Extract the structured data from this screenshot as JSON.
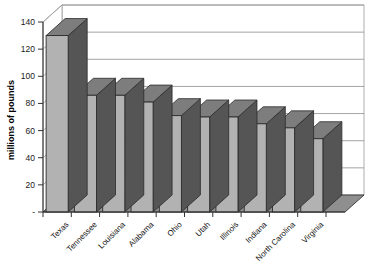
{
  "chart_data": {
    "type": "bar",
    "title": "",
    "subtitle": "",
    "xlabel": "",
    "ylabel": "millions of pounds",
    "ylim": [
      0,
      140
    ],
    "ytick_step": 20,
    "ytick_labels": [
      "-",
      "20",
      "40",
      "60",
      "80",
      "100",
      "120",
      "140"
    ],
    "grid": true,
    "grid_axis": "y",
    "legend": false,
    "style": "3d-column",
    "categories": [
      "Texas",
      "Tennessee",
      "Louisiana",
      "Alabama",
      "Ohio",
      "Utah",
      "Illinois",
      "Indiana",
      "North Carolina",
      "Virginia"
    ],
    "values": [
      130,
      86,
      86,
      81,
      71,
      70,
      70,
      65,
      62,
      54
    ],
    "series": [
      {
        "name": "millions of pounds",
        "values": [
          130,
          86,
          86,
          81,
          71,
          70,
          70,
          65,
          62,
          54
        ]
      }
    ],
    "category_label_rotation": -45
  },
  "colors": {
    "bar_face": "#b2b2b2",
    "bar_side": "#555555",
    "bar_top": "#7d7d7d",
    "bar_outline": "#2b2b2b",
    "floor": "#8f8f8f",
    "wall": "#ffffff",
    "gridline": "#9a9a9a",
    "axis": "#333333",
    "background": "#ffffff",
    "text": "#111111"
  }
}
